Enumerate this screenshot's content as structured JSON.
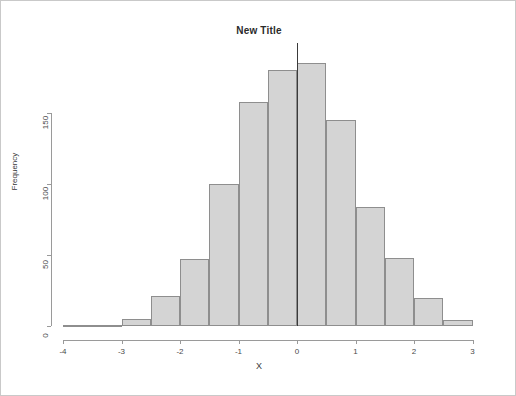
{
  "chart_data": {
    "type": "bar",
    "title": "New Title",
    "xlabel": "X",
    "ylabel": "Frequency",
    "subtitle": "",
    "grid": false,
    "legend": null,
    "bin_width": 0.5,
    "xlim": [
      -4,
      3
    ],
    "ylim": [
      0,
      190
    ],
    "xticks": [
      "-4",
      "-3",
      "-2",
      "-1",
      "0",
      "1",
      "2",
      "3"
    ],
    "xtick_values": [
      -4,
      -3,
      -2,
      -1,
      0,
      1,
      2,
      3
    ],
    "yticks": [
      "0",
      "50",
      "100",
      "150"
    ],
    "ytick_values": [
      0,
      50,
      100,
      150
    ],
    "annotations": [
      {
        "name": "zero-reference-line",
        "type": "vline",
        "x": 0,
        "color": "#3a3a3a"
      }
    ],
    "bin_edges": [
      -4,
      -3.5,
      -3,
      -2.5,
      -2,
      -1.5,
      -1,
      -0.5,
      0,
      0.5,
      1,
      1.5,
      2,
      2.5,
      3
    ],
    "categories": [
      "-4 to -3.5",
      "-3.5 to -3",
      "-3 to -2.5",
      "-2.5 to -2",
      "-2 to -1.5",
      "-1.5 to -1",
      "-1 to -0.5",
      "-0.5 to 0",
      "0 to 0.5",
      "0.5 to 1",
      "1 to 1.5",
      "1.5 to 2",
      "2 to 2.5",
      "2.5 to 3"
    ],
    "values": [
      1,
      1,
      5,
      21,
      47,
      100,
      158,
      180,
      185,
      145,
      84,
      48,
      20,
      4
    ],
    "bar_fill_color": "#d4d4d4",
    "bar_border_color": "#8e8e8e"
  },
  "colors": {
    "frame_border": "#c9c9c9",
    "axis": "#9a9a9a",
    "text": "#3a3a3a",
    "background": "#ffffff"
  }
}
